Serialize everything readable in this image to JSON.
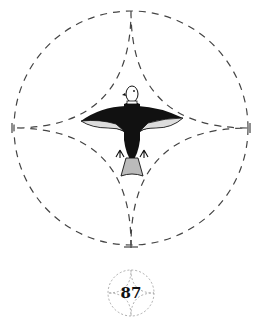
{
  "figure": {
    "page_number": "87",
    "main_motif": "bird-with-spread-wings",
    "construction": "dashed-circle-with-four-pointed-star",
    "colors": {
      "ink": "#111111",
      "dash": "#444444",
      "background": "#ffffff"
    }
  }
}
